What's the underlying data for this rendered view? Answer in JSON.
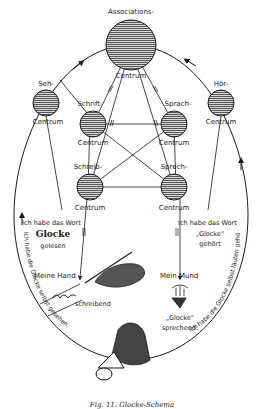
{
  "diagram": {
    "nodes": [
      {
        "id": "associations",
        "label_top": "Associations-",
        "label_bottom": "Centrum"
      },
      {
        "id": "seh",
        "label_top": "Seh-",
        "label_bottom": "Centrum"
      },
      {
        "id": "hoer",
        "label_top": "Hör-",
        "label_bottom": "Centrum"
      },
      {
        "id": "schrift",
        "label_top": "Schrift-",
        "label_bottom": "Centrum"
      },
      {
        "id": "sprach",
        "label_top": "Sprach-",
        "label_bottom": "Centrum"
      },
      {
        "id": "schreib",
        "label_top": "Schreib-",
        "label_bottom": "Centrum"
      },
      {
        "id": "sprech",
        "label_top": "Sprech-",
        "label_bottom": "Centrum"
      }
    ],
    "annotations": {
      "left_word": {
        "line1": "Ich habe das Wort",
        "word": "Glocke",
        "line3": "gelesen"
      },
      "right_word": {
        "line1": "Ich habe das Wort",
        "word": "„Glocke“",
        "line3": "gehört"
      },
      "hand": {
        "label": "Meine Hand",
        "script": "Glocke",
        "action": "schreibend"
      },
      "mouth": {
        "label": "Mein Mund",
        "word": "„Glocke“",
        "action": "sprechend."
      },
      "arc_left": "Ich habe die Glocke selbst gesehen.",
      "arc_right": "Ich habe die Glocke selbst läuten gehört."
    },
    "caption": "Fig. 11. Glocke-Schema"
  }
}
